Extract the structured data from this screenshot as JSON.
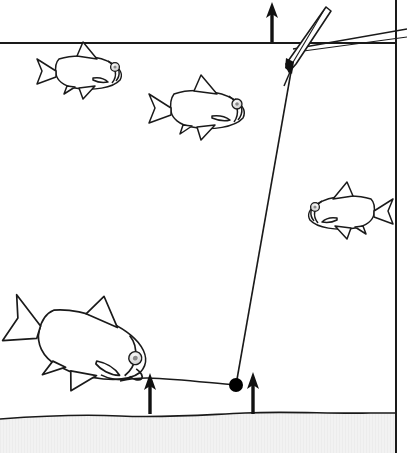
{
  "illustration": {
    "title": "Lift method bite indication on a waggler float rig",
    "type": "line-diagram",
    "width": 407,
    "height": 453,
    "background_color": "#ffffff",
    "line_color": "#000000"
  },
  "environment": {
    "water_surface": {
      "label": "water surface line",
      "y": 43,
      "x_start": 0,
      "x_end": 396,
      "color": "#1a1a1a"
    },
    "lakebed": {
      "label": "lake bed",
      "top_y": 414,
      "fill_color": "#f1f1f1",
      "edge_color": "#1a1a1a",
      "texture": "fine vertical grain"
    },
    "right_border": {
      "label": "panel right border",
      "x": 396,
      "y_start": 0,
      "y_end": 453,
      "color": "#1a1a1a"
    }
  },
  "tackle": {
    "float": {
      "name": "quill float",
      "tip_x": 327,
      "tip_y": 8,
      "base_x": 290,
      "base_y": 71,
      "tilt_description": "leaning right, cocked at an angle through the surface",
      "body_fill": "#ffffff",
      "body_stroke": "#000000"
    },
    "line_to_rod": {
      "name": "line to rod",
      "from_x": 293,
      "from_y": 49,
      "to_x": 407,
      "to_y": 29
    },
    "main_line": {
      "name": "main line below float",
      "from_x": 292,
      "from_y": 66,
      "to_x": 236,
      "to_y": 385
    },
    "shot": {
      "name": "lead shot weight",
      "cx": 236,
      "cy": 385,
      "radius": 7,
      "fill": "#000000"
    },
    "hook_length": {
      "name": "hook length along the bed",
      "from_x": 236,
      "from_y": 385,
      "to_x": 147,
      "to_y": 378
    }
  },
  "arrows": [
    {
      "name": "float-lift-arrow",
      "meaning": "float rises as shot is lifted",
      "x": 272,
      "y_tail": 42,
      "y_head": 3
    },
    {
      "name": "bait-lift-arrow",
      "meaning": "bait lifted by feeding fish",
      "x": 150,
      "y_tail": 414,
      "y_head": 374
    },
    {
      "name": "shot-lift-arrow",
      "meaning": "shot lifted clear of the bed",
      "x": 253,
      "y_tail": 414,
      "y_head": 373
    }
  ],
  "fish": [
    {
      "name": "small-roach-upper-left",
      "species_look": "roach",
      "facing": "right",
      "cx": 75,
      "cy": 72,
      "length": 95,
      "height": 42
    },
    {
      "name": "roach-mid-left",
      "species_look": "roach",
      "facing": "right",
      "cx": 192,
      "cy": 109,
      "length": 108,
      "height": 48
    },
    {
      "name": "roach-right",
      "species_look": "roach",
      "facing": "left",
      "cx": 355,
      "cy": 212,
      "length": 96,
      "height": 42
    },
    {
      "name": "feeding-tench-bottom",
      "species_look": "tench",
      "facing": "right-down",
      "cx": 78,
      "cy": 342,
      "length": 150,
      "height": 80,
      "posture": "head down, nose on the bed taking the bait"
    }
  ]
}
